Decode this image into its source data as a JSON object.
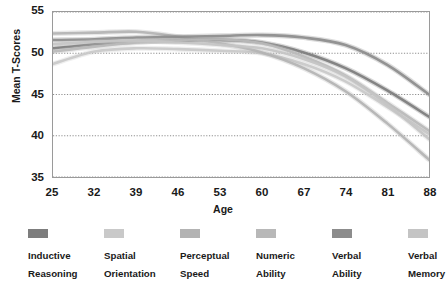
{
  "chart_data": {
    "type": "line",
    "title": "",
    "xlabel": "Age",
    "ylabel": "Mean T-Scores",
    "xlim": [
      25,
      88
    ],
    "ylim": [
      35,
      55
    ],
    "grid": true,
    "grid_axis": "y",
    "legend_position": "bottom",
    "x_ticks": [
      25,
      32,
      39,
      46,
      53,
      60,
      67,
      74,
      81,
      88
    ],
    "y_ticks": [
      35,
      40,
      45,
      50,
      55
    ],
    "x": [
      25,
      32,
      39,
      46,
      53,
      60,
      67,
      74,
      81,
      88
    ],
    "series": [
      {
        "name": "Inductive Reasoning",
        "color": "#7d7d7d",
        "values": [
          50.6,
          51.1,
          51.4,
          51.5,
          51.6,
          51.3,
          50.1,
          48.2,
          45.5,
          42.3
        ]
      },
      {
        "name": "Spatial Orientation",
        "color": "#c9c9c9",
        "values": [
          48.7,
          50.2,
          50.6,
          50.5,
          50.3,
          50.0,
          48.7,
          46.6,
          43.5,
          40.2
        ]
      },
      {
        "name": "Perceptual Speed",
        "color": "#b3b3b3",
        "values": [
          52.4,
          52.5,
          52.6,
          52.0,
          51.2,
          50.1,
          48.2,
          45.4,
          41.5,
          37.1
        ]
      },
      {
        "name": "Numeric Ability",
        "color": "#b8b8b8",
        "values": [
          50.2,
          50.8,
          51.3,
          51.6,
          51.7,
          51.2,
          49.6,
          47.3,
          44.0,
          40.6
        ]
      },
      {
        "name": "Verbal Ability",
        "color": "#8c8c8c",
        "values": [
          51.6,
          51.7,
          51.9,
          52.0,
          52.1,
          52.2,
          51.9,
          51.0,
          48.6,
          45.0
        ]
      },
      {
        "name": "Verbal Memory",
        "color": "#c4c4c4",
        "values": [
          51.1,
          51.4,
          51.5,
          51.3,
          51.0,
          50.6,
          49.3,
          47.2,
          43.8,
          39.6
        ]
      }
    ]
  },
  "axes": {
    "y_title": "Mean T-Scores",
    "x_title": "Age",
    "y_tick_labels": [
      "55",
      "50",
      "45",
      "40",
      "35"
    ],
    "x_tick_labels": [
      "25",
      "32",
      "39",
      "46",
      "53",
      "60",
      "67",
      "74",
      "81",
      "88"
    ]
  },
  "legend": {
    "items": [
      {
        "label": "Inductive\nReasoning",
        "color": "#7d7d7d"
      },
      {
        "label": "Spatial\nOrientation",
        "color": "#c9c9c9"
      },
      {
        "label": "Perceptual\nSpeed",
        "color": "#b3b3b3"
      },
      {
        "label": "Numeric\nAbility",
        "color": "#b8b8b8"
      },
      {
        "label": "Verbal\nAbility",
        "color": "#8c8c8c"
      },
      {
        "label": "Verbal\nMemory",
        "color": "#c4c4c4"
      }
    ]
  },
  "style": {
    "grid_color": "#808080",
    "frame_color": "#9a9a9a",
    "background": "#ffffff",
    "text_color": "#1a1a1a"
  }
}
